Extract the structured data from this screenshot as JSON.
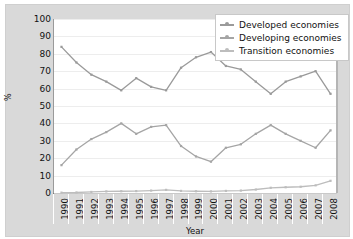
{
  "chart_data": {
    "type": "line",
    "title": "",
    "xlabel": "Year",
    "ylabel": "%",
    "ylim": [
      0,
      100
    ],
    "ytick_step": 10,
    "yticks": [
      100,
      90,
      80,
      70,
      60,
      50,
      40,
      30,
      20,
      10,
      0
    ],
    "grid": true,
    "legend_position": "top-right",
    "categories": [
      "1990",
      "1991",
      "1992",
      "1993",
      "1994",
      "1995",
      "1996",
      "1997",
      "1998",
      "1999",
      "2000",
      "2001",
      "2002",
      "2003",
      "2004",
      "2005",
      "2006",
      "2007",
      "2008"
    ],
    "series": [
      {
        "name": "Developed economies",
        "color": "#9a9a9a",
        "values": [
          84,
          75,
          68,
          64,
          59,
          66,
          61,
          59,
          72,
          78,
          81,
          73,
          71,
          64,
          57,
          64,
          67,
          70,
          57
        ]
      },
      {
        "name": "Developing economies",
        "color": "#a5a5a5",
        "values": [
          16,
          25,
          31,
          35,
          40,
          34,
          38,
          39,
          27,
          21,
          18,
          26,
          28,
          34,
          39,
          34,
          30,
          26,
          36
        ]
      },
      {
        "name": "Transition economies",
        "color": "#bdbdbd",
        "values": [
          0.2,
          0.3,
          0.6,
          0.9,
          1.0,
          1.1,
          1.4,
          1.8,
          1.2,
          1.0,
          0.9,
          1.2,
          1.4,
          2.0,
          3.0,
          3.3,
          3.6,
          4.4,
          7.0
        ]
      }
    ]
  },
  "legend": {
    "items": [
      {
        "label": "Developed economies"
      },
      {
        "label": "Developing economies"
      },
      {
        "label": "Transition economies"
      }
    ]
  },
  "axes": {
    "y_title": "%",
    "x_title": "Year"
  },
  "colors": {
    "frame_background": "#d9d9d9",
    "plot_background": "#ffffff",
    "gridline": "#ededed",
    "axis_line": "#9a9a9a",
    "text": "#111111"
  }
}
